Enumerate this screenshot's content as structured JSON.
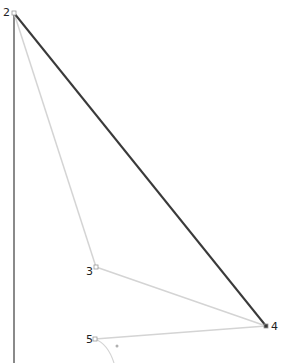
{
  "diagram": {
    "type": "point-path-diagram",
    "colors": {
      "background": "#ffffff",
      "axis_line": "#8a8a8a",
      "main_edge": "#3a3a3a",
      "guide_edge": "#d4d4d4",
      "curve": "#d4d4d4",
      "point_fill": "#ffffff",
      "point_stroke": "#9a9a9a",
      "label": "#222222",
      "dot": "#b0b0b0"
    },
    "points": [
      {
        "id": "2",
        "label": "2",
        "x": 14,
        "y": 13,
        "label_x": 3,
        "label_y": 7
      },
      {
        "id": "3",
        "label": "3",
        "x": 96,
        "y": 267,
        "label_x": 86,
        "label_y": 266
      },
      {
        "id": "4",
        "label": "4",
        "x": 266,
        "y": 326,
        "label_x": 271,
        "label_y": 321
      },
      {
        "id": "5",
        "label": "5",
        "x": 95,
        "y": 339,
        "label_x": 86,
        "label_y": 334
      }
    ],
    "edges": [
      {
        "from": "2",
        "to": "4",
        "style": "main"
      },
      {
        "from": "2",
        "to": "3",
        "style": "guide"
      },
      {
        "from": "3",
        "to": "4",
        "style": "guide"
      },
      {
        "from": "5",
        "to": "4",
        "style": "guide"
      }
    ],
    "vertical_line": {
      "x": 14,
      "y1": 13,
      "y2": 363
    },
    "curve": {
      "from": "5",
      "ctrl_x": 108,
      "ctrl_y": 344,
      "end_x": 114,
      "end_y": 363
    },
    "marker_dot": {
      "x": 117,
      "y": 346
    }
  }
}
